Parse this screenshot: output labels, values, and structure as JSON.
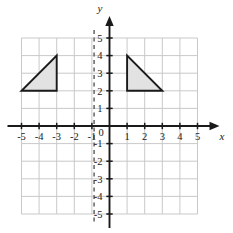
{
  "figure": {
    "kind": "coordinate-plane",
    "background_color": "#ffffff",
    "grid_color": "#c9c9c9",
    "axis_color": "#1a1a1a",
    "shape_fill": "#e2e2e2",
    "shape_stroke": "#1a1a1a",
    "dashed_line_color": "#6e6e6e"
  },
  "axes": {
    "x_label": "x",
    "y_label": "y",
    "origin_label": "0",
    "x_min": -5,
    "x_max": 5,
    "y_min": -5,
    "y_max": 5,
    "x_tick_labels": [
      "-5",
      "-4",
      "-3",
      "-2",
      "-1",
      "1",
      "2",
      "3",
      "4",
      "5"
    ],
    "x_tick_values": [
      -5,
      -4,
      -3,
      -2,
      -1,
      1,
      2,
      3,
      4,
      5
    ],
    "y_tick_labels": [
      "5",
      "4",
      "3",
      "2",
      "1",
      "-1",
      "-2",
      "-3",
      "-4",
      "-5"
    ],
    "y_tick_values": [
      5,
      4,
      3,
      2,
      1,
      -1,
      -2,
      -3,
      -4,
      -5
    ],
    "grid": true,
    "grid_step": 1
  },
  "dashed_line": {
    "orientation": "vertical",
    "x": -1,
    "y_from": -5,
    "y_to": 5
  },
  "shapes": [
    {
      "name": "left-triangle",
      "type": "triangle",
      "vertices": [
        [
          -5,
          2
        ],
        [
          -3,
          2
        ],
        [
          -3,
          4
        ]
      ],
      "filled": true
    },
    {
      "name": "right-triangle",
      "type": "triangle",
      "vertices": [
        [
          1,
          2
        ],
        [
          1,
          4
        ],
        [
          3,
          2
        ]
      ],
      "filled": true
    }
  ],
  "chart_data": {
    "type": "scatter",
    "title": "",
    "xlabel": "x",
    "ylabel": "y",
    "xlim": [
      -5,
      5
    ],
    "ylim": [
      -5,
      5
    ],
    "grid": true,
    "series": [
      {
        "name": "left-triangle",
        "x": [
          -5,
          -3,
          -3,
          -5
        ],
        "y": [
          2,
          2,
          4,
          2
        ]
      },
      {
        "name": "right-triangle",
        "x": [
          1,
          1,
          3,
          1
        ],
        "y": [
          2,
          4,
          2,
          2
        ]
      }
    ],
    "annotations": [
      {
        "name": "dashed-vertical-line",
        "x": -1
      }
    ]
  }
}
